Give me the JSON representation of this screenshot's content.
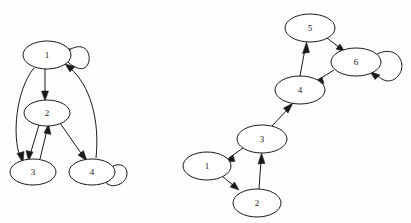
{
  "figure": {
    "title": "",
    "background_color": "#fefefe",
    "stroke_color": "#1a1a1a",
    "node_fill_color": "#ffffff",
    "width": 411,
    "height": 223
  },
  "graphs": [
    {
      "id": "graph-left",
      "name": "left-directed-graph",
      "node_count": 4,
      "nodes": [
        {
          "id": "L1",
          "label": "1",
          "cx": 47,
          "cy": 55,
          "rx": 24,
          "ry": 14
        },
        {
          "id": "L2",
          "label": "2",
          "cx": 47,
          "cy": 113,
          "rx": 23,
          "ry": 13
        },
        {
          "id": "L3",
          "label": "3",
          "cx": 33,
          "cy": 172,
          "rx": 23,
          "ry": 13
        },
        {
          "id": "L4",
          "label": "4",
          "cx": 92,
          "cy": 172,
          "rx": 23,
          "ry": 13
        }
      ],
      "edges": [
        {
          "from": "L1",
          "to": "L1",
          "type": "self-loop"
        },
        {
          "from": "L1",
          "to": "L2",
          "type": "straight"
        },
        {
          "from": "L1",
          "to": "L3",
          "type": "curve"
        },
        {
          "from": "L2",
          "to": "L3",
          "type": "straight"
        },
        {
          "from": "L3",
          "to": "L2",
          "type": "straight"
        },
        {
          "from": "L2",
          "to": "L4",
          "type": "straight"
        },
        {
          "from": "L4",
          "to": "L1",
          "type": "curve"
        },
        {
          "from": "L4",
          "to": "L4",
          "type": "self-loop"
        }
      ]
    },
    {
      "id": "graph-right",
      "name": "right-directed-graph",
      "node_count": 6,
      "nodes": [
        {
          "id": "R1",
          "label": "1",
          "cx": 207,
          "cy": 166,
          "rx": 24,
          "ry": 14
        },
        {
          "id": "R2",
          "label": "2",
          "cx": 257,
          "cy": 203,
          "rx": 24,
          "ry": 14
        },
        {
          "id": "R3",
          "label": "3",
          "cx": 262,
          "cy": 139,
          "rx": 25,
          "ry": 14
        },
        {
          "id": "R4",
          "label": "4",
          "cx": 300,
          "cy": 90,
          "rx": 25,
          "ry": 14
        },
        {
          "id": "R5",
          "label": "5",
          "cx": 310,
          "cy": 28,
          "rx": 25,
          "ry": 14
        },
        {
          "id": "R6",
          "label": "6",
          "cx": 356,
          "cy": 62,
          "rx": 25,
          "ry": 14
        }
      ],
      "edges": [
        {
          "from": "R3",
          "to": "R1",
          "type": "straight"
        },
        {
          "from": "R1",
          "to": "R2",
          "type": "straight"
        },
        {
          "from": "R2",
          "to": "R3",
          "type": "straight"
        },
        {
          "from": "R3",
          "to": "R4",
          "type": "straight"
        },
        {
          "from": "R4",
          "to": "R5",
          "type": "straight"
        },
        {
          "from": "R5",
          "to": "R6",
          "type": "straight"
        },
        {
          "from": "R6",
          "to": "R4",
          "type": "straight"
        },
        {
          "from": "R6",
          "to": "R6",
          "type": "self-loop"
        }
      ]
    }
  ],
  "labels": {
    "n1": "1",
    "n2": "2",
    "n3": "3",
    "n4": "4",
    "n5": "5",
    "n6": "6"
  }
}
